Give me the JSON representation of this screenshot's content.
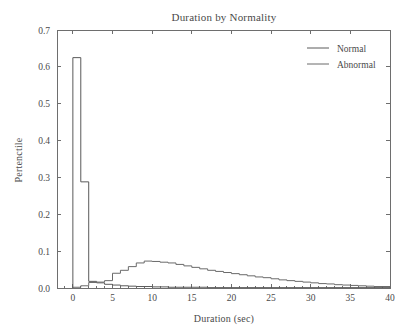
{
  "figure": {
    "width": 409,
    "height": 333,
    "background": "#ffffff",
    "foreground": "#4a4a4a"
  },
  "chart_data": {
    "type": "line",
    "subtype": "step-histogram",
    "title": "Duration by Normality",
    "xlabel": "Duration (sec)",
    "ylabel": "Pertenctile",
    "xlim": [
      -2,
      40
    ],
    "ylim": [
      0.0,
      0.7
    ],
    "xticks": [
      0,
      5,
      10,
      15,
      20,
      25,
      30,
      35,
      40
    ],
    "xtick_labels": [
      "0",
      "5",
      "10",
      "15",
      "20",
      "25",
      "30",
      "35",
      "40"
    ],
    "yticks": [
      0.0,
      0.1,
      0.2,
      0.3,
      0.4,
      0.5,
      0.6,
      0.7
    ],
    "ytick_labels": [
      "0.0",
      "0.1",
      "0.2",
      "0.3",
      "0.4",
      "0.5",
      "0.6",
      "0.7"
    ],
    "grid": false,
    "legend_position": "upper right",
    "bin_width": 1,
    "bin_edges_start": 0,
    "series": [
      {
        "name": "Normal",
        "color": "#5a5a5a",
        "values": [
          0.625,
          0.288,
          0.018,
          0.014,
          0.01,
          0.008,
          0.006,
          0.005,
          0.004,
          0.004,
          0.003,
          0.003,
          0.002,
          0.002,
          0.002,
          0.002,
          0.002,
          0.001,
          0.001,
          0.001,
          0.001,
          0.001,
          0.001,
          0.001,
          0.001,
          0.001,
          0.001,
          0.001,
          0.001,
          0.001,
          0.001,
          0.001,
          0.001,
          0.001,
          0.001,
          0.001,
          0.001,
          0.001,
          0.001,
          0.001
        ]
      },
      {
        "name": "Abnormal",
        "color": "#6a6a6a",
        "values": [
          0.002,
          0.006,
          0.015,
          0.016,
          0.02,
          0.04,
          0.048,
          0.058,
          0.068,
          0.073,
          0.072,
          0.07,
          0.068,
          0.064,
          0.06,
          0.056,
          0.052,
          0.048,
          0.045,
          0.042,
          0.039,
          0.036,
          0.033,
          0.03,
          0.028,
          0.025,
          0.022,
          0.02,
          0.018,
          0.016,
          0.014,
          0.012,
          0.011,
          0.009,
          0.008,
          0.007,
          0.006,
          0.005,
          0.004,
          0.004
        ]
      }
    ],
    "annotations": {
      "normal_peak_value": 0.625,
      "normal_peak_bin": "0-1 sec",
      "normal_second_bin_value": 0.288,
      "abnormal_peak_value": 0.073,
      "abnormal_peak_bin": "9-10 sec"
    }
  },
  "legend": {
    "entries": [
      {
        "label": "Normal",
        "color": "#5a5a5a"
      },
      {
        "label": "Abnormal",
        "color": "#6a6a6a"
      }
    ]
  }
}
